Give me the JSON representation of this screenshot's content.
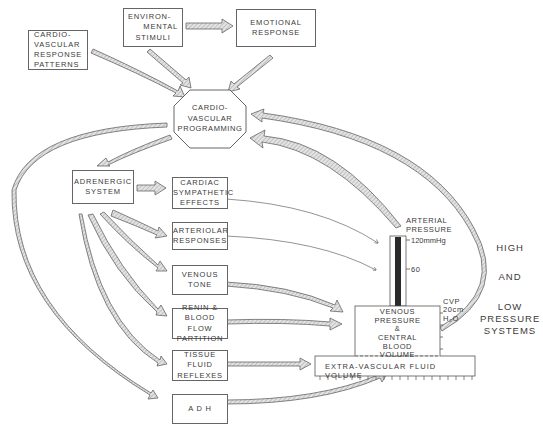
{
  "caption": "Cardiovascular programming and response systems (cut-off caption)",
  "nodes": {
    "environmental_stimuli": [
      "ENVIRON-",
      "MENTAL",
      "STIMULI"
    ],
    "emotional_response": [
      "EMOTIONAL",
      "RESPONSE"
    ],
    "cv_response_patterns": [
      "CARDIO-",
      "VASCULAR",
      "RESPONSE",
      "PATTERNS"
    ],
    "cv_programming": [
      "CARDIO-",
      "VASCULAR",
      "PROGRAMMING"
    ],
    "adrenergic_system": [
      "ADRENERGIC",
      "SYSTEM"
    ],
    "cardiac_sympathetic": [
      "CARDIAC",
      "SYMPATHETIC",
      "EFFECTS"
    ],
    "arteriolar_responses": [
      "ARTERIOLAR",
      "RESPONSES"
    ],
    "venous_tone": [
      "VENOUS",
      "TONE"
    ],
    "renin_blood_flow": [
      "RENIN &",
      "BLOOD FLOW",
      "PARTITION"
    ],
    "tissue_fluid": [
      "TISSUE",
      "FLUID",
      "REFLEXES"
    ],
    "adh": [
      "A D H"
    ],
    "venous_pressure": [
      "VENOUS",
      "PRESSURE",
      "&",
      "CENTRAL",
      "BLOOD",
      "VOLUME"
    ],
    "extra_vascular": "EXTRA-VASCULAR FLUID VOLUME"
  },
  "gauges": {
    "arterial_label": [
      "ARTERIAL",
      "PRESSURE"
    ],
    "arterial_top": "120mmHg",
    "arterial_mid": "60",
    "cvp_label": [
      "CVP",
      "20cm",
      "H₂O"
    ]
  },
  "side_label": {
    "line1": "HIGH",
    "line2": "AND",
    "line3": "LOW",
    "line4": "PRESSURE",
    "line5": "SYSTEMS"
  },
  "colors": {
    "line": "#555555",
    "arrow_fill": "#cfcfcf",
    "column_fill": "#2a2a2a"
  }
}
